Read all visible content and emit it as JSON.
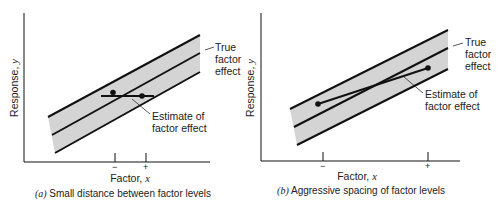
{
  "panels": [
    {
      "id": "a",
      "ylabel": "Response, ",
      "ylabel_var": "y",
      "xlabel": "Factor, ",
      "xlabel_var": "x",
      "tick_minus": "−",
      "tick_plus": "+",
      "caption_letter": "(a)",
      "caption": " Small distance between factor levels",
      "true_label": [
        "True",
        "factor",
        "effect"
      ],
      "estimate_label": [
        "Estimate of",
        "factor effect"
      ]
    },
    {
      "id": "b",
      "ylabel": "Response, ",
      "ylabel_var": "y",
      "xlabel": "Factor, ",
      "xlabel_var": "x",
      "tick_minus": "−",
      "tick_plus": "+",
      "caption_letter": "(b)",
      "caption": " Aggressive spacing of factor levels",
      "true_label": [
        "True",
        "factor",
        "effect"
      ],
      "estimate_label": [
        "Estimate of",
        "factor effect"
      ]
    }
  ],
  "colors": {
    "band_fill": "#d4d4d4",
    "line": "#111111"
  }
}
